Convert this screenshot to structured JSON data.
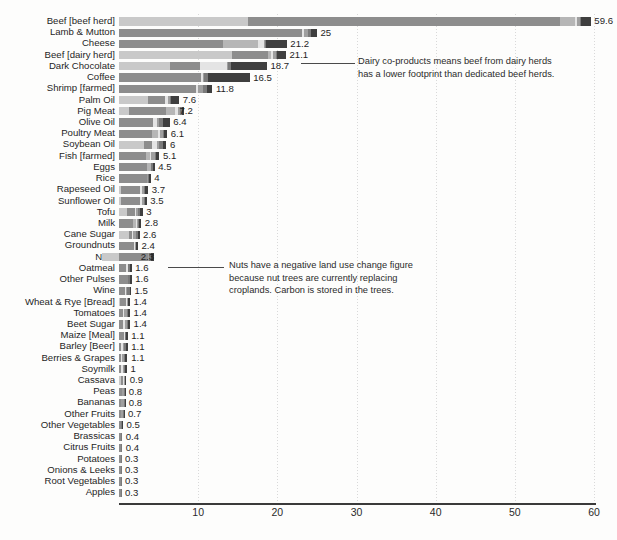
{
  "chart_data": {
    "type": "bar",
    "orientation": "horizontal",
    "stacked": true,
    "title": "",
    "subtitle": "",
    "xlabel": "",
    "ylabel": "",
    "xlim": [
      0,
      60
    ],
    "xticks": [
      10,
      20,
      30,
      40,
      50,
      60
    ],
    "grid": true,
    "legend_position": "none",
    "categories": [
      "Beef [beef herd]",
      "Lamb & Mutton",
      "Cheese",
      "Beef [dairy herd]",
      "Dark Chocolate",
      "Coffee",
      "Shrimp [farmed]",
      "Palm Oil",
      "Pig Meat",
      "Olive Oil",
      "Poultry Meat",
      "Soybean Oil",
      "Fish [farmed]",
      "Eggs",
      "Rice",
      "Rapeseed Oil",
      "Sunflower Oil",
      "Tofu",
      "Milk",
      "Cane Sugar",
      "Groundnuts",
      "Nuts",
      "Oatmeal",
      "Other Pulses",
      "Wine",
      "Wheat & Rye [Bread]",
      "Tomatoes",
      "Beet Sugar",
      "Maize [Meal]",
      "Barley [Beer]",
      "Berries & Grapes",
      "Soymilk",
      "Cassava",
      "Peas",
      "Bananas",
      "Other Fruits",
      "Other Vegetables",
      "Brassicas",
      "Citrus Fruits",
      "Potatoes",
      "Onions & Leeks",
      "Root Vegetables",
      "Apples"
    ],
    "values": [
      59.6,
      25,
      21.2,
      21.1,
      18.7,
      16.5,
      11.8,
      7.6,
      7.2,
      6.4,
      6.1,
      6,
      5.1,
      4.5,
      4,
      3.7,
      3.5,
      3,
      2.8,
      2.6,
      2.4,
      2.3,
      1.6,
      1.6,
      1.5,
      1.4,
      1.4,
      1.4,
      1.1,
      1.1,
      1.1,
      1,
      0.9,
      0.8,
      0.8,
      0.7,
      0.5,
      0.4,
      0.4,
      0.3,
      0.3,
      0.3,
      0.3
    ],
    "value_labels": [
      "59.6",
      "25",
      "21.2",
      "21.1",
      "18.7",
      "16.5",
      "11.8",
      "7.6",
      "7.2",
      "6.4",
      "6.1",
      "6",
      "5.1",
      "4.5",
      "4",
      "3.7",
      "3.5",
      "3",
      "2.8",
      "2.6",
      "2.4",
      "2.3",
      "1.6",
      "1.6",
      "1.5",
      "1.4",
      "1.4",
      "1.4",
      "1.1",
      "1.1",
      "1.1",
      "1",
      "0.9",
      "0.8",
      "0.8",
      "0.7",
      "0.5",
      "0.4",
      "0.4",
      "0.3",
      "0.3",
      "0.3",
      "0.3"
    ],
    "series": [
      {
        "name": "Land use change",
        "color": "#c9c9c9",
        "values": [
          16.3,
          0.0,
          0.0,
          14.3,
          6.5,
          0.0,
          0.0,
          3.6,
          1.3,
          0.0,
          0.0,
          3.1,
          0.0,
          0.0,
          0.0,
          0.2,
          0.2,
          1.0,
          0.0,
          1.2,
          0.0,
          -2.1,
          0.0,
          0.0,
          0.0,
          0.1,
          0.0,
          0.0,
          0.0,
          0.0,
          0.0,
          0.0,
          0.2,
          0.0,
          0.0,
          0.0,
          0.0,
          0.0,
          0.0,
          0.0,
          0.0,
          0.0,
          0.0
        ]
      },
      {
        "name": "Farm",
        "color": "#8d8d8d",
        "values": [
          39.4,
          23.1,
          13.1,
          4.5,
          3.7,
          10.4,
          9.7,
          2.2,
          4.6,
          4.3,
          4.2,
          1.1,
          3.4,
          3.5,
          3.5,
          2.5,
          2.5,
          1.0,
          1.8,
          0.5,
          1.9,
          3.6,
          0.9,
          1.1,
          0.8,
          0.8,
          0.5,
          0.5,
          0.6,
          0.2,
          0.3,
          0.2,
          0.3,
          0.4,
          0.3,
          0.2,
          0.2,
          0.2,
          0.2,
          0.2,
          0.2,
          0.2,
          0.2
        ]
      },
      {
        "name": "Animal feed",
        "color": "#b6b6b6",
        "values": [
          1.9,
          0.0,
          4.5,
          0.4,
          0.0,
          0.0,
          0.0,
          0.0,
          1.2,
          0.0,
          0.7,
          0.0,
          0.5,
          0.5,
          0.0,
          0.0,
          0.0,
          0.0,
          0.4,
          0.0,
          0.0,
          0.0,
          0.0,
          0.0,
          0.0,
          0.0,
          0.0,
          0.0,
          0.0,
          0.0,
          0.0,
          0.0,
          0.0,
          0.0,
          0.0,
          0.0,
          0.0,
          0.0,
          0.0,
          0.0,
          0.0,
          0.0,
          0.0
        ]
      },
      {
        "name": "Processing",
        "color": "#e4e4e4",
        "values": [
          0.3,
          0.3,
          0.7,
          0.3,
          3.5,
          0.2,
          0.3,
          0.4,
          0.3,
          0.5,
          0.3,
          0.6,
          0.1,
          0.0,
          0.1,
          0.2,
          0.2,
          0.2,
          0.1,
          0.1,
          0.1,
          0.1,
          0.2,
          0.0,
          0.1,
          0.1,
          0.1,
          0.3,
          0.1,
          0.3,
          0.1,
          0.3,
          0.1,
          0.0,
          0.0,
          0.1,
          0.0,
          0.0,
          0.0,
          0.0,
          0.0,
          0.0,
          0.0
        ]
      },
      {
        "name": "Transport",
        "color": "#9f9f9f",
        "values": [
          0.3,
          0.5,
          0.1,
          0.3,
          0.1,
          0.2,
          0.6,
          0.2,
          0.3,
          0.3,
          0.3,
          0.3,
          0.5,
          0.1,
          0.1,
          0.2,
          0.2,
          0.2,
          0.1,
          0.4,
          0.1,
          0.1,
          0.1,
          0.1,
          0.1,
          0.1,
          0.4,
          0.2,
          0.1,
          0.1,
          0.2,
          0.1,
          0.1,
          0.2,
          0.3,
          0.2,
          0.1,
          0.1,
          0.1,
          0.0,
          0.0,
          0.0,
          0.0
        ]
      },
      {
        "name": "Packaging",
        "color": "#7a7a7a",
        "values": [
          0.2,
          0.3,
          0.2,
          0.2,
          0.3,
          0.5,
          0.5,
          0.2,
          0.2,
          0.5,
          0.2,
          0.5,
          0.2,
          0.2,
          0.1,
          0.2,
          0.2,
          0.3,
          0.1,
          0.2,
          0.1,
          0.2,
          0.2,
          0.2,
          0.4,
          0.1,
          0.2,
          0.2,
          0.1,
          0.3,
          0.2,
          0.2,
          0.1,
          0.1,
          0.1,
          0.1,
          0.1,
          0.1,
          0.1,
          0.1,
          0.1,
          0.1,
          0.1
        ]
      },
      {
        "name": "Retail",
        "color": "#3f3f3f",
        "values": [
          1.2,
          0.8,
          2.6,
          1.1,
          4.6,
          5.2,
          0.7,
          1.0,
          0.3,
          0.8,
          0.4,
          0.4,
          0.4,
          0.2,
          0.2,
          0.4,
          0.2,
          0.3,
          0.3,
          0.2,
          0.2,
          0.4,
          0.2,
          0.2,
          0.1,
          0.2,
          0.2,
          0.2,
          0.2,
          0.2,
          0.2,
          0.2,
          0.1,
          0.1,
          0.1,
          0.1,
          0.1,
          0.0,
          0.0,
          0.0,
          0.0,
          0.0,
          0.0
        ]
      }
    ],
    "annotations": [
      {
        "id": "beef-dairy-note",
        "target_category": "Beef [dairy herd]",
        "text": "Dairy co-products means beef from dairy herds has a lower footprint than dedicated beef herds."
      },
      {
        "id": "nuts-note",
        "target_category": "Nuts",
        "text": "Nuts have a negative land use change figure because nut trees are currently replacing croplands. Carbon is stored in the trees."
      }
    ]
  },
  "colors": {
    "axis": "#3a3a3a",
    "grid": "#d9d9d9",
    "text": "#1f1f1f",
    "background": "#fdfdfc"
  }
}
